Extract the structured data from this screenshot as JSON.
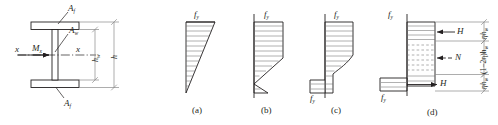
{
  "figure": {
    "type": "engineering-diagram"
  },
  "cross_section": {
    "flange_top_label": "A",
    "flange_top_sub": "f",
    "web_label": "A",
    "web_sub": "w",
    "flange_bottom_label": "A",
    "flange_bottom_sub": "f",
    "moment_label": "M",
    "moment_sub": "x",
    "axis_left_label": "x",
    "axis_right_label": "x",
    "dim_web_label": "h",
    "dim_web_sub": "w",
    "dim_total_label": "h"
  },
  "diagrams": [
    {
      "caption": "(a)",
      "stress_top_label": "f",
      "stress_top_sub": "y",
      "stress_bottom_label": "",
      "stress_bottom_sub": "",
      "stage": "elastic-partial-yield"
    },
    {
      "caption": "(b)",
      "stress_top_label": "f",
      "stress_top_sub": "y",
      "stress_bottom_label": "",
      "stress_bottom_sub": "",
      "stage": "partial-plastification"
    },
    {
      "caption": "(c)",
      "stress_top_label": "f",
      "stress_top_sub": "y",
      "stress_bottom_label": "f",
      "stress_bottom_sub": "y",
      "stage": "advanced-plastification"
    },
    {
      "caption": "(d)",
      "stress_top_label": "f",
      "stress_top_sub": "y",
      "stress_bottom_label": "f",
      "stress_bottom_sub": "y",
      "stage": "fully-plastic-stress-block",
      "force_top_label": "H",
      "force_mid_label": "N",
      "force_bottom_label": "H",
      "dim_top": "ηh",
      "dim_top_sub": "w",
      "dim_mid": "(1−2η)h",
      "dim_mid_sub": "w",
      "dim_bottom": "ηh",
      "dim_bottom_sub": "w"
    }
  ],
  "colors": {
    "line": "#231f20",
    "hatch": "#6f6f6f",
    "dim": "#8a8a8a",
    "background": "#ffffff"
  }
}
